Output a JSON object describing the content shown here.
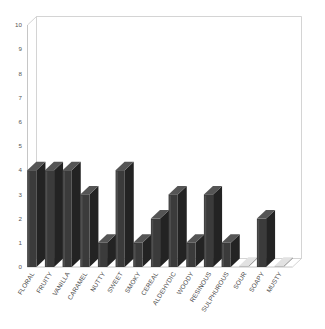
{
  "chart_data": {
    "type": "bar",
    "title": "",
    "subtitle": "",
    "xlabel": "",
    "ylabel": "",
    "ylim": [
      0,
      10
    ],
    "ytick_labels": [
      "0",
      "1",
      "2",
      "3",
      "4",
      "5",
      "6",
      "7",
      "8",
      "9",
      "10"
    ],
    "ytick_values": [
      0,
      1,
      2,
      3,
      4,
      5,
      6,
      7,
      8,
      9,
      10
    ],
    "grid": false,
    "legend": false,
    "legend_position": "none",
    "style": "3d-bar",
    "bar_color": "#3b3b3b",
    "bar_side_color": "#232323",
    "bar_top_color": "#555555",
    "background_color": "#ffffff",
    "axis_color": "#b8b8b8",
    "categories": [
      "FLORAL",
      "FRUITY",
      "VANILLA",
      "CARAMEL",
      "NUTTY",
      "SWEET",
      "SMOKY",
      "CEREAL",
      "ALDEHYDIC",
      "WOODY",
      "RESINOUS",
      "SULPHUROUS",
      "SOUR",
      "SOAPY",
      "MUSTY"
    ],
    "values": [
      4,
      4,
      4,
      3,
      1,
      4,
      1,
      2,
      3,
      1,
      3,
      1,
      0,
      2,
      0
    ]
  }
}
